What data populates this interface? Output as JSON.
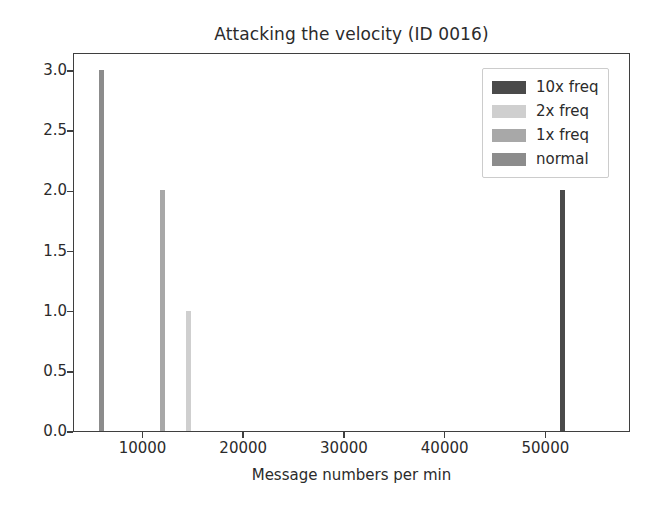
{
  "chart_data": {
    "type": "bar",
    "title": "Attacking the velocity (ID 0016)",
    "xlabel": "Message numbers per min",
    "ylabel": "",
    "xlim": [
      3100,
      58400
    ],
    "ylim": [
      0.0,
      3.15
    ],
    "grid": false,
    "legend_position": "upper right",
    "xticks": [
      10000,
      20000,
      30000,
      40000,
      50000
    ],
    "xtick_labels": [
      "10000",
      "20000",
      "30000",
      "40000",
      "50000"
    ],
    "yticks": [
      0.0,
      0.5,
      1.0,
      1.5,
      2.0,
      2.5,
      3.0
    ],
    "ytick_labels": [
      "0.0",
      "0.5",
      "1.0",
      "1.5",
      "2.0",
      "2.5",
      "3.0"
    ],
    "bar_width_px": 5,
    "series": [
      {
        "name": "10x freq",
        "color": "#4a4a4a",
        "points": [
          {
            "x": 51600,
            "y": 2.0
          }
        ]
      },
      {
        "name": "2x freq",
        "color": "#cfcfcf",
        "points": [
          {
            "x": 14500,
            "y": 1.0
          }
        ]
      },
      {
        "name": "1x freq",
        "color": "#a8a8a8",
        "points": [
          {
            "x": 11900,
            "y": 2.0
          }
        ]
      },
      {
        "name": "normal",
        "color": "#8c8c8c",
        "points": [
          {
            "x": 5800,
            "y": 3.0
          }
        ]
      }
    ]
  },
  "legend": {
    "entries": [
      {
        "label": "10x freq",
        "color": "#4a4a4a"
      },
      {
        "label": "2x freq",
        "color": "#cfcfcf"
      },
      {
        "label": "1x freq",
        "color": "#a8a8a8"
      },
      {
        "label": "normal",
        "color": "#8c8c8c"
      }
    ]
  },
  "colors": {
    "axis": "#3f3f3f",
    "text": "#2b2b2b",
    "background": "#ffffff",
    "legend_border": "#cccccc"
  }
}
